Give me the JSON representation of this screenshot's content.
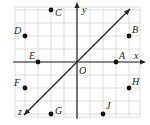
{
  "diagram": {
    "type": "coordinate-grid",
    "grid": {
      "x_min": -5,
      "x_max": 5,
      "y_min": -4,
      "y_max": 4,
      "cell_px": 13,
      "origin_px": [
        77,
        62
      ]
    },
    "axes": {
      "x_label": "x",
      "y_label": "y",
      "origin_label": "O"
    },
    "line": {
      "label": "z",
      "from": [
        -4,
        -4
      ],
      "to": [
        4,
        4
      ]
    },
    "points": [
      {
        "name": "A",
        "x": 3,
        "y": 0
      },
      {
        "name": "B",
        "x": 4,
        "y": 2
      },
      {
        "name": "C",
        "x": -2,
        "y": 4
      },
      {
        "name": "D",
        "x": -4,
        "y": 2
      },
      {
        "name": "E",
        "x": -3,
        "y": 0
      },
      {
        "name": "F",
        "x": -4,
        "y": -2
      },
      {
        "name": "G",
        "x": -2,
        "y": -4
      },
      {
        "name": "H",
        "x": 4,
        "y": -2
      },
      {
        "name": "J",
        "x": 2,
        "y": -4
      }
    ],
    "colors": {
      "grid": "#d4d4d4",
      "axis": "#222222",
      "point": "#111111"
    }
  }
}
